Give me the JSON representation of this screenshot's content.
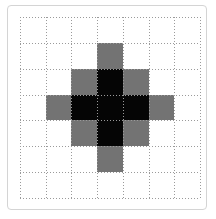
{
  "figure": {
    "title": "",
    "frame_color": "#d4d4d4",
    "background_color": "#ffffff",
    "gridline_color": "#9a9a9a",
    "gridline_style": "dotted"
  },
  "chart_data": {
    "type": "heatmap",
    "title": "",
    "xlabel": "",
    "ylabel": "",
    "grid": true,
    "legend_position": "none",
    "rows": 7,
    "cols": 7,
    "xlim": [
      0,
      7
    ],
    "ylim": [
      0,
      7
    ],
    "x": [
      0,
      1,
      2,
      3,
      4,
      5,
      6
    ],
    "y": [
      0,
      1,
      2,
      3,
      4,
      5,
      6
    ],
    "xtick_labels": [
      "",
      "",
      "",
      "",
      "",
      "",
      ""
    ],
    "ytick_labels": [
      "",
      "",
      "",
      "",
      "",
      "",
      ""
    ],
    "value_colors": {
      "0": "#ffffff",
      "1": "#737373",
      "2": "#050505"
    },
    "value_names": {
      "0": "empty",
      "1": "gray",
      "2": "black"
    },
    "values": [
      [
        0,
        0,
        0,
        0,
        0,
        0,
        0
      ],
      [
        0,
        0,
        0,
        1,
        0,
        0,
        0
      ],
      [
        0,
        0,
        1,
        2,
        1,
        0,
        0
      ],
      [
        0,
        1,
        2,
        2,
        2,
        1,
        0
      ],
      [
        0,
        0,
        1,
        2,
        1,
        0,
        0
      ],
      [
        0,
        0,
        0,
        1,
        0,
        0,
        0
      ],
      [
        0,
        0,
        0,
        0,
        0,
        0,
        0
      ]
    ]
  }
}
